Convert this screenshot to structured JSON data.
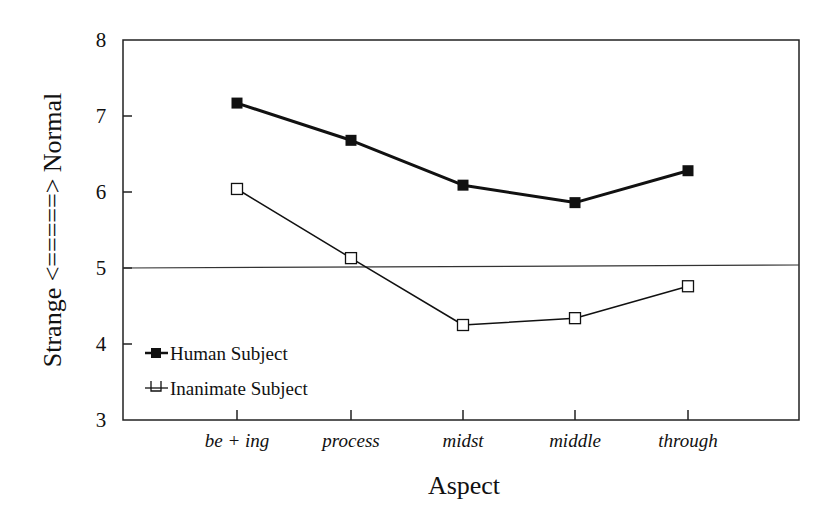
{
  "chart_data": {
    "type": "line",
    "title": "",
    "xlabel": "Aspect",
    "ylabel": "Strange <=====> Normal",
    "categories": [
      "be + ing",
      "process",
      "midst",
      "middle",
      "through"
    ],
    "series": [
      {
        "name": "Human Subject",
        "marker": "filled-square",
        "line_width": 3,
        "color": "#111111",
        "values": [
          7.17,
          6.68,
          6.09,
          5.86,
          6.28
        ]
      },
      {
        "name": "Inanimate Subject",
        "marker": "open-square",
        "line_width": 1.5,
        "color": "#111111",
        "values": [
          6.04,
          5.13,
          4.25,
          4.34,
          4.76
        ]
      }
    ],
    "ylim": [
      3,
      8
    ],
    "yticks": [
      3,
      4,
      5,
      6,
      7,
      8
    ],
    "reference_line": 5,
    "grid": false,
    "legend_position": "lower-left-inside"
  },
  "legend": {
    "items": [
      "Human Subject",
      "Inanimate Subject"
    ]
  },
  "axes": {
    "x_title": "Aspect",
    "y_title": "Strange <=====> Normal"
  }
}
